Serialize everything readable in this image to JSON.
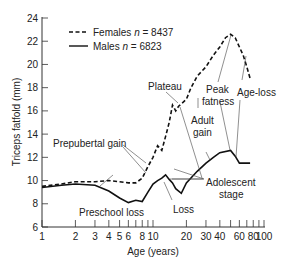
{
  "chart_data": {
    "type": "line",
    "title": "",
    "xlabel": "Age (years)",
    "ylabel": "Triceps fatfold (mm)",
    "xscale": "log",
    "xlim": [
      1,
      100
    ],
    "ylim": [
      6,
      24
    ],
    "yticks": [
      6,
      8,
      10,
      12,
      14,
      16,
      18,
      20,
      22,
      24
    ],
    "xticks": [
      1,
      2,
      3,
      4,
      5,
      6,
      7,
      8,
      9,
      10,
      20,
      30,
      40,
      50,
      60,
      70,
      80,
      90,
      100
    ],
    "xtick_labels": [
      {
        "value": 1,
        "label": "1"
      },
      {
        "value": 2,
        "label": "2"
      },
      {
        "value": 3,
        "label": "3"
      },
      {
        "value": 4,
        "label": "4"
      },
      {
        "value": 5,
        "label": "5"
      },
      {
        "value": 6,
        "label": "6"
      },
      {
        "value": 8,
        "label": "8"
      },
      {
        "value": 10,
        "label": "10"
      },
      {
        "value": 20,
        "label": "20"
      },
      {
        "value": 30,
        "label": "30"
      },
      {
        "value": 40,
        "label": "40"
      },
      {
        "value": 60,
        "label": "60"
      },
      {
        "value": 80,
        "label": "80"
      },
      {
        "value": 100,
        "label": "100"
      }
    ],
    "grid": false,
    "legend_position": "top-left",
    "series": [
      {
        "name": "Females",
        "legend_label": "Females",
        "n_label": "n",
        "n_value": "= 8437",
        "style": "dashed",
        "x": [
          1,
          1.5,
          2,
          3,
          4,
          5,
          6,
          7,
          8,
          9,
          10,
          11,
          12,
          13,
          14,
          15,
          16,
          17,
          18,
          20,
          22,
          25,
          30,
          35,
          40,
          45,
          50,
          55,
          60,
          65,
          70,
          75
        ],
        "values": [
          9.5,
          9.7,
          9.9,
          9.9,
          10.0,
          9.9,
          9.8,
          9.8,
          10.2,
          11.2,
          12.0,
          13.0,
          12.6,
          13.8,
          15.0,
          16.5,
          16.0,
          16.4,
          16.6,
          17.0,
          18.0,
          19.0,
          19.8,
          20.8,
          21.5,
          22.3,
          22.6,
          22.3,
          21.5,
          20.8,
          19.8,
          18.8
        ]
      },
      {
        "name": "Males",
        "legend_label": "Males",
        "n_label": "n",
        "n_value": "= 6823",
        "style": "solid",
        "x": [
          1,
          1.5,
          2,
          3,
          4,
          5,
          6,
          7,
          8,
          9,
          10,
          11,
          12,
          13,
          14,
          15,
          16,
          18,
          20,
          25,
          30,
          35,
          40,
          50,
          55,
          60,
          70,
          75
        ],
        "values": [
          9.4,
          9.6,
          9.7,
          9.6,
          9.1,
          8.5,
          8.1,
          8.3,
          8.2,
          9.0,
          9.7,
          10.0,
          10.2,
          10.5,
          10.1,
          9.8,
          9.3,
          8.9,
          9.8,
          10.8,
          11.5,
          12.0,
          12.4,
          12.6,
          12.1,
          11.5,
          11.5,
          11.5
        ]
      }
    ],
    "annotations": [
      {
        "text": "Plateau",
        "target_series": "Females",
        "target_x": 17,
        "target_y": 16.4
      },
      {
        "text": "Peak",
        "text2": "fatness",
        "target_series": "Females",
        "target_x": 55,
        "target_y": 22.6
      },
      {
        "text": "Age-loss",
        "target_series": "Females/Males",
        "target_x": 70,
        "target_y": 20.5
      },
      {
        "text": "Adult",
        "text2": "gain",
        "target_series": "Females/Males",
        "target_x": 35,
        "target_y": 12
      },
      {
        "text": "Prepubertal gain",
        "target_series": "Females/Males",
        "target_x": 9,
        "target_y": 10.5
      },
      {
        "text": "Adolescent",
        "text2": "stage",
        "target_series": "Males",
        "target_x": 13,
        "target_y": 10.5
      },
      {
        "text": "Preschool loss",
        "target_series": "Males",
        "target_x": 4,
        "target_y": 9
      },
      {
        "text": "Loss",
        "target_series": "Males",
        "target_x": 15,
        "target_y": 9.8
      }
    ]
  },
  "labels": {
    "ylabel": "Triceps fatfold (mm)",
    "xlabel": "Age (years)",
    "legend_females": "Females",
    "legend_males": "Males",
    "legend_n": "n",
    "legend_females_n": "= 8437",
    "legend_males_n": "= 6823",
    "plateau": "Plateau",
    "peak1": "Peak",
    "peak2": "fatness",
    "ageloss": "Age-loss",
    "adult1": "Adult",
    "adult2": "gain",
    "prepubertal": "Prepubertal gain",
    "adolescent1": "Adolescent",
    "adolescent2": "stage",
    "preschool": "Preschool loss",
    "loss": "Loss"
  },
  "colors": {
    "line": "#111111",
    "axis": "#333333",
    "leader": "#444444",
    "text": "#222222"
  }
}
